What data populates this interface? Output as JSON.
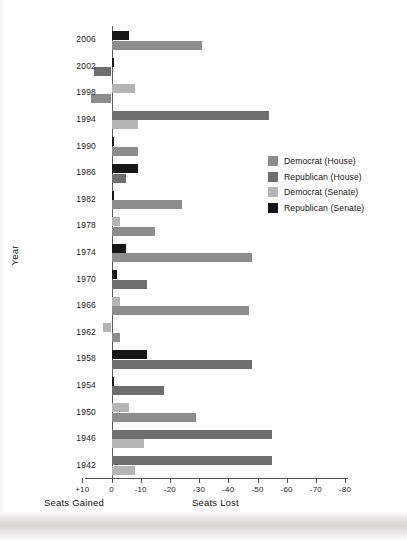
{
  "chart_data": {
    "type": "bar",
    "orientation": "horizontal",
    "title": "",
    "xlabel_left": "Seats Gained",
    "xlabel_right": "Seats Lost",
    "ylabel": "Year",
    "grid": false,
    "legend_position": "right-middle",
    "xticks": [
      "+10",
      "0",
      "-10",
      "-20",
      "-30",
      "-40",
      "-50",
      "-60",
      "-70",
      "-80"
    ],
    "xtick_values": [
      10,
      0,
      -10,
      -20,
      -30,
      -40,
      -50,
      -60,
      -70,
      -80
    ],
    "xlim": [
      10,
      -80
    ],
    "categories": [
      "2006",
      "2002",
      "1998",
      "1994",
      "1990",
      "1986",
      "1982",
      "1978",
      "1974",
      "1970",
      "1966",
      "1962",
      "1958",
      "1954",
      "1950",
      "1946",
      "1942"
    ],
    "series": [
      {
        "name": "Democrat (House)",
        "color": "#8d8d8d",
        "values": [
          -31,
          0,
          7,
          0,
          -9,
          0,
          -24,
          -15,
          -48,
          0,
          -47,
          -3,
          0,
          0,
          -29,
          0,
          0
        ]
      },
      {
        "name": "Republican (House)",
        "color": "#6e6e6e",
        "values": [
          0,
          6,
          0,
          -54,
          0,
          -5,
          0,
          0,
          0,
          -12,
          0,
          0,
          -48,
          -18,
          0,
          -55,
          -55
        ]
      },
      {
        "name": "Democrat (Senate)",
        "color": "#b5b5b5",
        "values": [
          0,
          0,
          -8,
          -9,
          0,
          0,
          0,
          -3,
          0,
          0,
          -3,
          3,
          0,
          0,
          -6,
          -11,
          -8
        ]
      },
      {
        "name": "Republican (Senate)",
        "color": "#161616",
        "values": [
          -6,
          -1,
          0,
          0,
          -1,
          -9,
          -1,
          0,
          -5,
          -2,
          0,
          0,
          -12,
          -1,
          0,
          0,
          0
        ]
      }
    ]
  },
  "legend": {
    "items": [
      {
        "label": "Democrat (House)",
        "color": "#8d8d8d"
      },
      {
        "label": "Republican (House)",
        "color": "#6e6e6e"
      },
      {
        "label": "Democrat (Senate)",
        "color": "#b5b5b5"
      },
      {
        "label": "Republican (Senate)",
        "color": "#161616"
      }
    ]
  },
  "axes": {
    "y_title": "Year",
    "x_title_left": "Seats Gained",
    "x_title_right": "Seats Lost"
  }
}
